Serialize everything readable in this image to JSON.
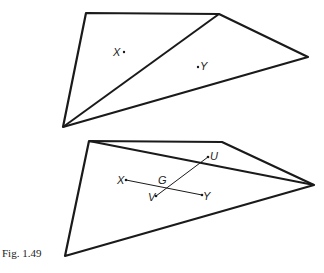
{
  "caption": "Fig. 1.49",
  "top_figure": {
    "labels": {
      "x": "X",
      "y": "Y"
    }
  },
  "bottom_figure": {
    "labels": {
      "x": "X",
      "y": "Y",
      "u": "U",
      "v": "V",
      "g": "G"
    }
  },
  "colors": {
    "stroke": "#1a1a1a"
  }
}
